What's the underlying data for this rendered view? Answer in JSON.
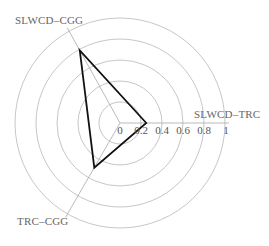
{
  "chart_data": {
    "type": "radar",
    "title": "",
    "axes": [
      "SLWCD–TRC",
      "SLWCD–CGG",
      "TRC–CGG"
    ],
    "series": [
      {
        "name": "",
        "values": [
          0.25,
          0.79,
          0.49
        ],
        "color": "#111111"
      }
    ],
    "rlim": [
      0,
      1
    ],
    "r_ticks": [
      "0",
      "0.2",
      "0.4",
      "0.6",
      "0.8",
      "1"
    ],
    "grid": true,
    "legend": null
  },
  "labels": {
    "axis_0": "SLWCD–TRC",
    "axis_1": "SLWCD–CGG",
    "axis_2": "TRC–CGG"
  },
  "ticks": [
    "0",
    "0.2",
    "0.4",
    "0.6",
    "0.8",
    "1"
  ]
}
